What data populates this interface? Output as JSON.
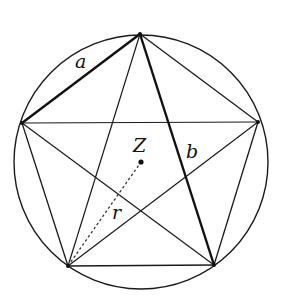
{
  "diagram": {
    "circle": {
      "cx": 141,
      "cy": 162,
      "r": 127,
      "stroke": "#1a1a1a"
    },
    "center_point": {
      "label": "Z",
      "x": 141,
      "y": 162
    },
    "vertices": {
      "top": {
        "x": 140,
        "y": 34
      },
      "left": {
        "x": 22,
        "y": 123
      },
      "right": {
        "x": 258,
        "y": 122
      },
      "bottom_left": {
        "x": 68,
        "y": 266
      },
      "bottom_right": {
        "x": 214,
        "y": 265
      }
    },
    "labels": {
      "side": "a",
      "diagonal": "b",
      "center": "Z",
      "radius": "r"
    },
    "label_positions": {
      "a": {
        "x": 75,
        "y": 68
      },
      "b": {
        "x": 186,
        "y": 158
      },
      "Z": {
        "x": 133,
        "y": 152
      },
      "r": {
        "x": 112,
        "y": 219
      }
    },
    "segments": {
      "side_a": {
        "from": "top",
        "to": "left",
        "style": "bold"
      },
      "diagonal_b": {
        "from": "top",
        "to": "bottom_right",
        "style": "bold"
      },
      "radius_r": {
        "from": "center",
        "to": "bottom_left",
        "style": "dotted"
      }
    },
    "colors": {
      "line": "#1a1a1a",
      "background": "#ffffff"
    }
  }
}
